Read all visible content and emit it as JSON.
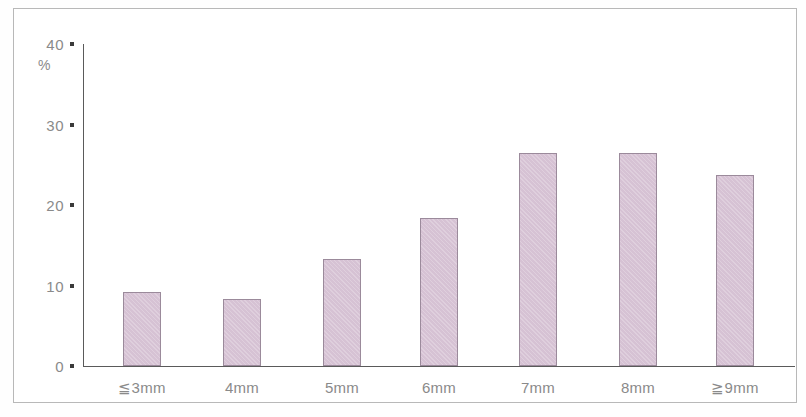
{
  "chart_data": {
    "type": "bar",
    "title": "",
    "subtitle": "",
    "xlabel": "",
    "ylabel": "%",
    "categories": [
      "≦3mm",
      "4mm",
      "5mm",
      "6mm",
      "7mm",
      "8mm",
      "≧9mm"
    ],
    "values": [
      9.2,
      8.3,
      13.3,
      18.4,
      26.5,
      26.5,
      23.7
    ],
    "ylim": [
      0,
      40
    ],
    "ytick_labels": [
      "0",
      "10",
      "20",
      "30",
      "40"
    ],
    "ytick_values": [
      0,
      10,
      20,
      30,
      40
    ],
    "unit": "%",
    "grid": false,
    "legend": null,
    "annotations": [],
    "colors": {
      "bar_fill": "#d6c2d4",
      "bar_stroke": "#9b8a9b",
      "axis": "#5a5a5a",
      "tick_mark": "#3a3a3a",
      "label_text": "#8a8a8a",
      "frame": "#b8b8b8",
      "background": "#ffffff"
    }
  }
}
